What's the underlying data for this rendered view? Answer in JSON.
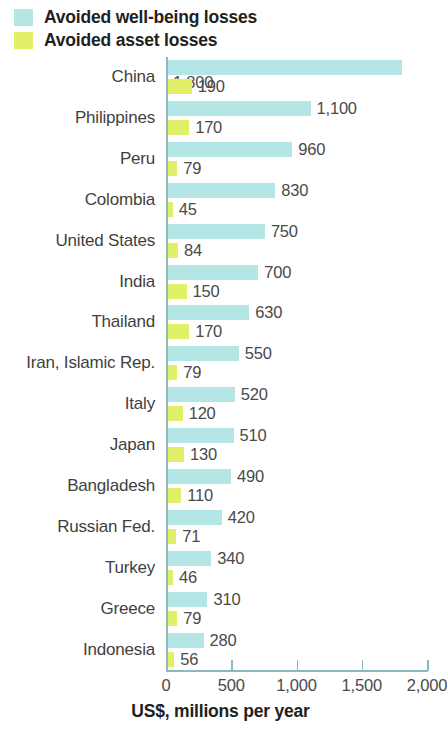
{
  "legend": {
    "items": [
      {
        "label": "Avoided well-being losses",
        "color": "#b4e6e6",
        "key": "wellbeing"
      },
      {
        "label": "Avoided asset losses",
        "color": "#e2f067",
        "key": "asset"
      }
    ]
  },
  "axis": {
    "title": "US$, millions per year",
    "ticks": [
      "0",
      "500",
      "1,000",
      "1,500",
      "2,000"
    ],
    "tick_values": [
      0,
      500,
      1000,
      1500,
      2000
    ]
  },
  "chart_data": {
    "type": "bar",
    "title": "",
    "subtitle": "",
    "orientation": "horizontal",
    "grouped": true,
    "xlabel": "US$, millions per year",
    "ylabel": "",
    "xlim": [
      0,
      2000
    ],
    "xticks": [
      0,
      500,
      1000,
      1500,
      2000
    ],
    "xticklabels": [
      "0",
      "500",
      "1,000",
      "1,500",
      "2,000"
    ],
    "grid": false,
    "legend_position": "top-left",
    "categories": [
      "China",
      "Philippines",
      "Peru",
      "Colombia",
      "United States",
      "India",
      "Thailand",
      "Iran, Islamic Rep.",
      "Italy",
      "Japan",
      "Bangladesh",
      "Russian Fed.",
      "Turkey",
      "Greece",
      "Indonesia"
    ],
    "series": [
      {
        "name": "Avoided well-being losses",
        "color": "#b4e6e6",
        "values": [
          1800,
          1100,
          960,
          830,
          750,
          700,
          630,
          550,
          520,
          510,
          490,
          420,
          340,
          310,
          280
        ],
        "labels": [
          "1,800",
          "1,100",
          "960",
          "830",
          "750",
          "700",
          "630",
          "550",
          "520",
          "510",
          "490",
          "420",
          "340",
          "310",
          "280"
        ]
      },
      {
        "name": "Avoided asset losses",
        "color": "#e2f067",
        "values": [
          190,
          170,
          79,
          45,
          84,
          150,
          170,
          79,
          120,
          130,
          110,
          71,
          46,
          79,
          56
        ],
        "labels": [
          "190",
          "170",
          "79",
          "45",
          "84",
          "150",
          "170",
          "79",
          "120",
          "130",
          "110",
          "71",
          "46",
          "79",
          "56"
        ]
      }
    ]
  }
}
